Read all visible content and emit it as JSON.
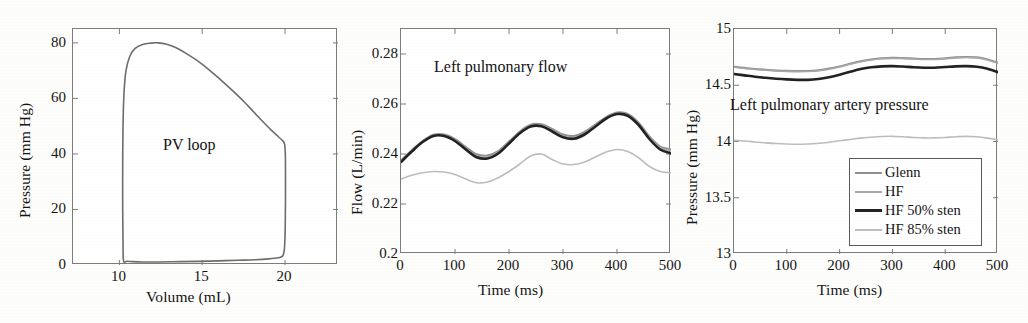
{
  "figure": {
    "background": "#fdfdfc",
    "axis_color": "#7c7c7c",
    "text_color": "#141414"
  },
  "series_colors": {
    "glenn": "#8f8f8f",
    "hf": "#a8a8a8",
    "hf_50_sten": "#222222",
    "hf_85_sten": "#bdbdbd"
  },
  "legend": {
    "position": "lower-right-panel3",
    "items": [
      {
        "label": "Glenn",
        "color": "#8f8f8f",
        "width": 2.0
      },
      {
        "label": "HF",
        "color": "#a8a8a8",
        "width": 1.6
      },
      {
        "label": "HF 50% sten",
        "color": "#222222",
        "width": 2.6
      },
      {
        "label": "HF 85% sten",
        "color": "#bdbdbd",
        "width": 1.6
      }
    ]
  },
  "chart_data": [
    {
      "type": "line",
      "id": "pv-loop",
      "title": "PV loop",
      "title_position": "inside-center",
      "xlabel": "Volume (mL)",
      "ylabel": "Pressure (mm Hg)",
      "xlim": [
        7.2,
        23.2
      ],
      "ylim": [
        0,
        85
      ],
      "xticks": [
        10,
        15,
        20
      ],
      "yticks": [
        0,
        20,
        40,
        60,
        80
      ],
      "grid": false,
      "series": [
        {
          "name": "PV loop trace",
          "color": "#6d6d6d",
          "closed": true,
          "points": [
            [
              10.25,
              1.5
            ],
            [
              10.22,
              8
            ],
            [
              10.2,
              20
            ],
            [
              10.2,
              35
            ],
            [
              10.22,
              50
            ],
            [
              10.28,
              62
            ],
            [
              10.4,
              70
            ],
            [
              10.62,
              75
            ],
            [
              10.95,
              78
            ],
            [
              11.4,
              79.4
            ],
            [
              11.9,
              79.9
            ],
            [
              12.35,
              80.0
            ],
            [
              12.85,
              79.5
            ],
            [
              13.4,
              78.3
            ],
            [
              14.0,
              76.3
            ],
            [
              14.7,
              73.6
            ],
            [
              15.4,
              70.4
            ],
            [
              16.1,
              66.8
            ],
            [
              16.8,
              63.0
            ],
            [
              17.5,
              59.0
            ],
            [
              18.1,
              55.2
            ],
            [
              18.7,
              51.4
            ],
            [
              19.2,
              48.4
            ],
            [
              19.6,
              46.2
            ],
            [
              19.85,
              44.8
            ],
            [
              19.97,
              43.6
            ],
            [
              20.02,
              40.0
            ],
            [
              20.03,
              33.0
            ],
            [
              20.03,
              25.0
            ],
            [
              20.02,
              17.0
            ],
            [
              20.0,
              10.0
            ],
            [
              19.95,
              5.0
            ],
            [
              19.85,
              3.2
            ],
            [
              19.6,
              2.6
            ],
            [
              19.0,
              2.2
            ],
            [
              18.2,
              1.9
            ],
            [
              17.2,
              1.7
            ],
            [
              16.0,
              1.5
            ],
            [
              14.8,
              1.3
            ],
            [
              13.6,
              1.2
            ],
            [
              12.4,
              1.1
            ],
            [
              11.4,
              1.1
            ],
            [
              10.8,
              1.2
            ],
            [
              10.45,
              1.35
            ],
            [
              10.25,
              1.5
            ]
          ]
        }
      ]
    },
    {
      "type": "line",
      "id": "left-pulmonary-flow",
      "title": "Left pulmonary flow",
      "title_position": "inside-top",
      "xlabel": "Time (ms)",
      "ylabel": "Flow (L/min)",
      "xlim": [
        0,
        500
      ],
      "ylim": [
        0.2,
        0.29
      ],
      "xticks": [
        0,
        100,
        200,
        300,
        400,
        500
      ],
      "yticks": [
        0.2,
        0.22,
        0.24,
        0.26,
        0.28
      ],
      "ytick_labels": [
        "0.2",
        "0.22",
        "0.24",
        "0.26",
        "0.28"
      ],
      "grid": false,
      "x": [
        0,
        20,
        40,
        60,
        80,
        100,
        120,
        140,
        160,
        180,
        200,
        220,
        240,
        260,
        280,
        300,
        320,
        340,
        360,
        380,
        400,
        420,
        440,
        460,
        480,
        500
      ],
      "series": [
        {
          "name": "Glenn",
          "color": "#8f8f8f",
          "width": 2.0,
          "values": [
            0.2375,
            0.2415,
            0.2452,
            0.2477,
            0.2478,
            0.246,
            0.2428,
            0.2399,
            0.2394,
            0.2412,
            0.245,
            0.249,
            0.2517,
            0.2519,
            0.25,
            0.2478,
            0.2472,
            0.2488,
            0.2518,
            0.2548,
            0.2566,
            0.256,
            0.2525,
            0.247,
            0.243,
            0.2418
          ]
        },
        {
          "name": "HF",
          "color": "#a8a8a8",
          "width": 1.6,
          "values": [
            0.237,
            0.2412,
            0.245,
            0.2474,
            0.2474,
            0.2455,
            0.2422,
            0.2392,
            0.2388,
            0.2408,
            0.2447,
            0.2488,
            0.2514,
            0.2515,
            0.2495,
            0.2472,
            0.2466,
            0.2483,
            0.2514,
            0.2545,
            0.2563,
            0.2557,
            0.2521,
            0.2466,
            0.2426,
            0.2414
          ]
        },
        {
          "name": "HF 50% sten",
          "color": "#222222",
          "width": 2.6,
          "values": [
            0.2368,
            0.241,
            0.2448,
            0.2472,
            0.2472,
            0.2452,
            0.2418,
            0.2387,
            0.2382,
            0.2402,
            0.2442,
            0.2483,
            0.251,
            0.2511,
            0.249,
            0.2467,
            0.2461,
            0.2478,
            0.251,
            0.2542,
            0.256,
            0.2553,
            0.2516,
            0.246,
            0.2418,
            0.2403
          ]
        },
        {
          "name": "HF 85% sten",
          "color": "#bdbdbd",
          "width": 1.6,
          "values": [
            0.23,
            0.2315,
            0.2325,
            0.233,
            0.2328,
            0.2318,
            0.23,
            0.2285,
            0.2288,
            0.2305,
            0.233,
            0.236,
            0.2392,
            0.24,
            0.2378,
            0.236,
            0.2358,
            0.2368,
            0.2388,
            0.2408,
            0.2418,
            0.241,
            0.2385,
            0.235,
            0.233,
            0.2325
          ]
        }
      ]
    },
    {
      "type": "line",
      "id": "left-pulmonary-artery-pressure",
      "title": "Left pulmonary artery pressure",
      "title_position": "inside-middle",
      "xlabel": "Time (ms)",
      "ylabel": "Pressure (mm Hg)",
      "xlim": [
        0,
        500
      ],
      "ylim": [
        13,
        15
      ],
      "xticks": [
        0,
        100,
        200,
        300,
        400,
        500
      ],
      "yticks": [
        13,
        13.5,
        14,
        14.5,
        15
      ],
      "ytick_labels": [
        "13",
        "13.5",
        "14",
        "14.5",
        "15"
      ],
      "grid": false,
      "x": [
        0,
        20,
        40,
        60,
        80,
        100,
        120,
        140,
        160,
        180,
        200,
        220,
        240,
        260,
        280,
        300,
        320,
        340,
        360,
        380,
        400,
        420,
        440,
        460,
        480,
        500
      ],
      "series": [
        {
          "name": "Glenn",
          "color": "#8f8f8f",
          "width": 2.0,
          "values": [
            14.665,
            14.655,
            14.645,
            14.638,
            14.632,
            14.628,
            14.626,
            14.627,
            14.634,
            14.648,
            14.668,
            14.692,
            14.714,
            14.73,
            14.74,
            14.744,
            14.742,
            14.738,
            14.734,
            14.734,
            14.74,
            14.748,
            14.752,
            14.748,
            14.73,
            14.7
          ]
        },
        {
          "name": "HF",
          "color": "#a8a8a8",
          "width": 1.6,
          "values": [
            14.66,
            14.65,
            14.64,
            14.633,
            14.627,
            14.623,
            14.621,
            14.622,
            14.629,
            14.643,
            14.663,
            14.687,
            14.709,
            14.725,
            14.735,
            14.739,
            14.737,
            14.733,
            14.729,
            14.729,
            14.735,
            14.743,
            14.747,
            14.743,
            14.725,
            14.695
          ]
        },
        {
          "name": "HF 50% sten",
          "color": "#222222",
          "width": 2.6,
          "values": [
            14.6,
            14.588,
            14.576,
            14.566,
            14.558,
            14.552,
            14.548,
            14.548,
            14.556,
            14.572,
            14.594,
            14.62,
            14.644,
            14.66,
            14.668,
            14.67,
            14.666,
            14.66,
            14.656,
            14.656,
            14.662,
            14.668,
            14.67,
            14.664,
            14.646,
            14.616
          ]
        },
        {
          "name": "HF 85% sten",
          "color": "#bdbdbd",
          "width": 1.6,
          "values": [
            14.01,
            14.004,
            13.996,
            13.988,
            13.982,
            13.978,
            13.976,
            13.978,
            13.984,
            13.994,
            14.006,
            14.018,
            14.03,
            14.038,
            14.044,
            14.046,
            14.042,
            14.036,
            14.032,
            14.032,
            14.036,
            14.042,
            14.046,
            14.042,
            14.03,
            14.014
          ]
        }
      ]
    }
  ]
}
